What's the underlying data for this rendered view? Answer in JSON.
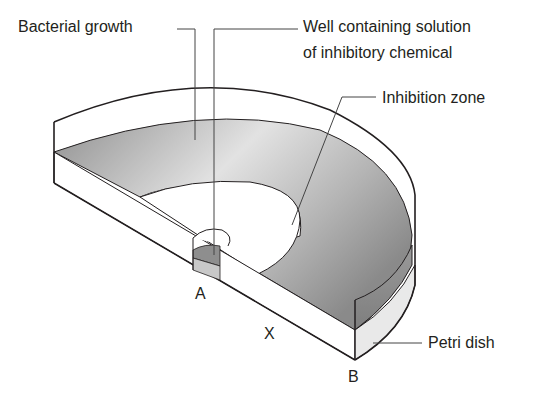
{
  "diagram": {
    "labels": {
      "bacterial_growth": "Bacterial growth",
      "well_line1": "Well containing solution",
      "well_line2": "of inhibitory chemical",
      "inhibition_zone": "Inhibition zone",
      "petri_dish": "Petri dish",
      "point_a": "A",
      "point_x": "X",
      "point_b": "B"
    },
    "colors": {
      "outline": "#231f20",
      "growth_dark": "#8c8c8c",
      "growth_light": "#e6e6e6",
      "dish_side": "#e9e9e9",
      "well_top": "#8e8e8e",
      "well_side": "#c8c8c8",
      "leader": "#555555"
    }
  }
}
